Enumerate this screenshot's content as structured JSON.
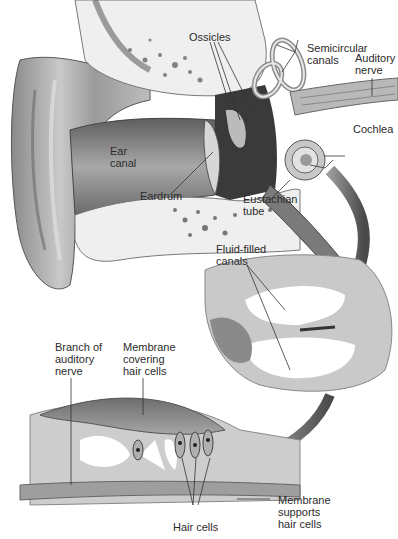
{
  "diagram": {
    "type": "anatomical-illustration",
    "panels": [
      {
        "name": "outer-middle-inner-ear",
        "labels": [
          {
            "id": "ossicles",
            "text": "Ossicles"
          },
          {
            "id": "semicircular-canals",
            "lines": [
              "Semicircular",
              "canals"
            ]
          },
          {
            "id": "auditory-nerve",
            "lines": [
              "Auditory",
              "nerve"
            ]
          },
          {
            "id": "cochlea",
            "text": "Cochlea"
          },
          {
            "id": "ear-canal",
            "lines": [
              "Ear",
              "canal"
            ]
          },
          {
            "id": "eardrum",
            "text": "Eardrum"
          },
          {
            "id": "eustachian-tube",
            "lines": [
              "Eustachian",
              "tube"
            ]
          }
        ]
      },
      {
        "name": "cochlea-cross-section",
        "labels": [
          {
            "id": "fluid-filled-canals",
            "lines": [
              "Fluid-filled",
              "canals"
            ]
          }
        ]
      },
      {
        "name": "organ-of-corti-detail",
        "labels": [
          {
            "id": "branch-of-auditory-nerve",
            "lines": [
              "Branch of",
              "auditory",
              "nerve"
            ]
          },
          {
            "id": "membrane-covering-hair-cells",
            "lines": [
              "Membrane",
              "covering",
              "hair cells"
            ]
          },
          {
            "id": "hair-cells",
            "text": "Hair cells"
          },
          {
            "id": "membrane-supports-hair-cells",
            "lines": [
              "Membrane",
              "supports",
              "hair cells"
            ]
          }
        ]
      }
    ]
  }
}
